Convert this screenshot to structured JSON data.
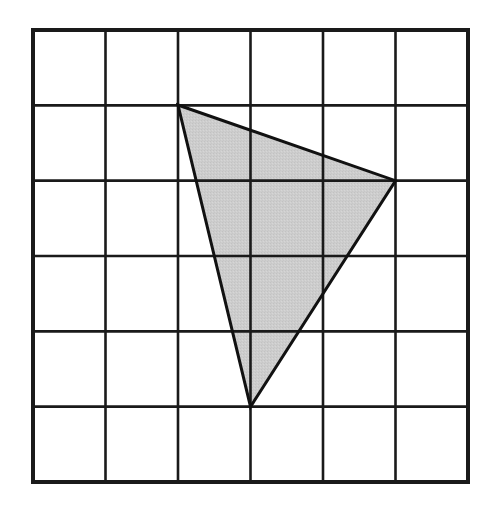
{
  "figure": {
    "type": "geometry-grid-figure",
    "background_color": "#ffffff"
  },
  "chart_data": {
    "type": "diagram",
    "subtitle": "",
    "xlabel": "",
    "ylabel": "",
    "grid": {
      "columns": 6,
      "rows": 6,
      "cell_count": 36,
      "grid_on": true,
      "origin_label": "top-left",
      "pixel_bounds": {
        "left": 33,
        "top": 30,
        "right": 468,
        "bottom": 482,
        "width": 435,
        "height": 452
      },
      "cell_width_px": 72.5,
      "cell_height_px": 75.33,
      "border_color": "#1a1a1a",
      "border_width_px": 4,
      "line_color": "#1a1a1a",
      "line_width_px": 2.6,
      "fill_color": "#ffffff"
    },
    "shapes": [
      {
        "name": "shaded-triangle",
        "kind": "polygon",
        "sides": 3,
        "fill_color": "#cccccc",
        "stroke_color": "#111111",
        "stroke_width_px": 3,
        "vertices_grid": [
          {
            "label": "top-left-vertex",
            "col": 2,
            "row": 1
          },
          {
            "label": "right-vertex",
            "col": 5,
            "row": 2
          },
          {
            "label": "bottom-vertex",
            "col": 3,
            "row": 5
          }
        ],
        "vertices_px": [
          {
            "label": "top-left-vertex",
            "x": 178,
            "y": 105
          },
          {
            "label": "right-vertex",
            "x": 395.5,
            "y": 180.7
          },
          {
            "label": "bottom-vertex",
            "x": 250.5,
            "y": 406.7
          }
        ]
      }
    ],
    "legend": [],
    "annotations": []
  },
  "colors": {
    "ink": "#1a1a1a",
    "outline": "#111111",
    "shade": "#cccccc",
    "paper": "#ffffff"
  }
}
